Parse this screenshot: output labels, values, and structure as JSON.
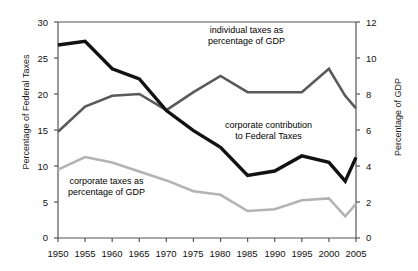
{
  "chart_data": {
    "type": "line",
    "title": "",
    "xlabel": "",
    "ylabel": "Percentage of Federal Taxes",
    "y2label": "Percentage of GDP",
    "x": [
      1950,
      1955,
      1960,
      1965,
      1970,
      1975,
      1980,
      1985,
      1990,
      1995,
      2000,
      2003,
      2005
    ],
    "xlim": [
      1950,
      2005
    ],
    "xticks": [
      "1950",
      "1955",
      "1960",
      "1965",
      "1970",
      "1975",
      "1980",
      "1985",
      "1990",
      "1995",
      "2000",
      "2005"
    ],
    "ylim": [
      0,
      30
    ],
    "yticks": [
      "0",
      "5",
      "10",
      "15",
      "20",
      "25",
      "30"
    ],
    "y2lim": [
      0,
      12
    ],
    "y2ticks": [
      "0",
      "2",
      "4",
      "6",
      "8",
      "10",
      "12"
    ],
    "grid": false,
    "legend": "annotations-inline",
    "series": [
      {
        "name": "corporate contribution to Federal Taxes",
        "axis": "left",
        "units": "Percentage of Federal Taxes",
        "color": "#121212",
        "values": [
          26.8,
          27.3,
          23.5,
          22.1,
          17.7,
          14.9,
          12.6,
          8.7,
          9.3,
          11.4,
          10.5,
          7.9,
          11.2
        ]
      },
      {
        "name": "individual taxes as percentage of GDP",
        "axis": "right",
        "units": "Percentage of GDP",
        "color": "#5a5a5a",
        "values": [
          5.9,
          7.3,
          7.9,
          8.0,
          7.1,
          8.1,
          9.0,
          8.1,
          8.1,
          8.1,
          9.4,
          7.9,
          7.2
        ]
      },
      {
        "name": "corporate taxes as percentage of GDP",
        "axis": "right",
        "units": "Percentage of GDP",
        "color": "#b3b3b3",
        "values": [
          3.8,
          4.5,
          4.2,
          3.7,
          3.2,
          2.6,
          2.4,
          1.5,
          1.6,
          2.1,
          2.2,
          1.2,
          1.9
        ]
      }
    ],
    "annotations": [
      {
        "id": "individual-annot",
        "line1": "individual taxes as",
        "line2": "percentage of GDP"
      },
      {
        "id": "corporate-federal-annot",
        "line1": "corporate contribution",
        "line2": "to Federal Taxes"
      },
      {
        "id": "corporate-gdp-annot",
        "line1": "corporate taxes as",
        "line2": "percentage of GDP"
      }
    ]
  }
}
